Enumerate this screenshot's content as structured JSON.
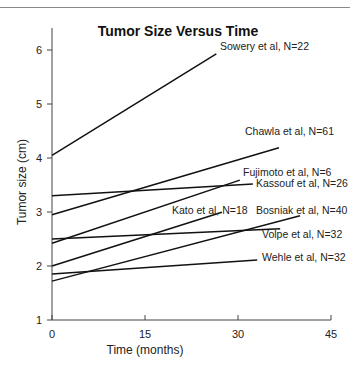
{
  "chart_data": {
    "type": "line",
    "title": "Tumor Size Versus Time",
    "xlabel": "Time (months)",
    "ylabel": "Tumor size (cm)",
    "xlim": [
      0,
      45
    ],
    "ylim": [
      1,
      6.3
    ],
    "xticks": [
      0,
      15,
      30,
      45
    ],
    "yticks": [
      1,
      2,
      3,
      4,
      5,
      6
    ],
    "grid": false,
    "legend": "inline labels at line ends",
    "series": [
      {
        "name": "Sowery et al, N=22",
        "x": [
          0,
          26.5
        ],
        "y": [
          4.05,
          5.93
        ],
        "label_pos": [
          220,
          50
        ]
      },
      {
        "name": "Chawla et al, N=61",
        "x": [
          0,
          36.6
        ],
        "y": [
          2.95,
          4.19
        ],
        "label_pos": [
          245,
          135
        ]
      },
      {
        "name": "Fujimoto et al, N=6",
        "x": [
          0,
          30.3
        ],
        "y": [
          2.42,
          3.59
        ],
        "label_pos": [
          243,
          176
        ]
      },
      {
        "name": "Kassouf et al, N=26",
        "x": [
          0,
          32.4
        ],
        "y": [
          3.3,
          3.52
        ],
        "label_pos": [
          256,
          187
        ]
      },
      {
        "name": "Kato et al, N=18",
        "x": [
          0,
          27.4
        ],
        "y": [
          2.0,
          2.996
        ],
        "label_pos": [
          172,
          214
        ]
      },
      {
        "name": "Bosniak et al, N=40",
        "x": [
          0,
          40.0
        ],
        "y": [
          1.72,
          2.93
        ],
        "label_pos": [
          256,
          214
        ]
      },
      {
        "name": "Volpe et al, N=32",
        "x": [
          0,
          36.8
        ],
        "y": [
          2.5,
          2.69
        ],
        "label_pos": [
          262,
          238
        ]
      },
      {
        "name": "Wehle et al, N=32",
        "x": [
          0,
          33.1
        ],
        "y": [
          1.85,
          2.11
        ],
        "label_pos": [
          262,
          261
        ]
      }
    ]
  }
}
